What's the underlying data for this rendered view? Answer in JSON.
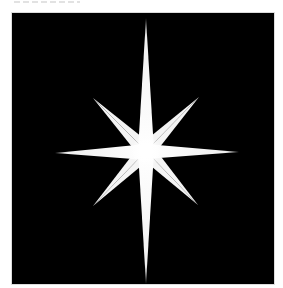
{
  "image": {
    "subject": "eight-pointed white star on black background",
    "background_color": "#000000",
    "star_color": "#ffffff",
    "frame_border_color": "#dcdcdc",
    "page_background": "#ffffff"
  },
  "star": {
    "center": [
      134,
      138
    ],
    "long_rays": {
      "up": [
        134,
        5
      ],
      "down": [
        134,
        271
      ],
      "left": [
        43,
        140
      ],
      "right": [
        227,
        139
      ]
    },
    "short_rays": {
      "up_left": [
        81,
        85
      ],
      "up_right": [
        187,
        84
      ],
      "down_left": [
        81,
        193
      ],
      "down_right": [
        186,
        192
      ]
    }
  }
}
